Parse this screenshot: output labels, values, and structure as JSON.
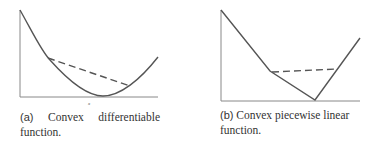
{
  "figures": [
    {
      "id": "a",
      "label": "(a)",
      "caption_line1_words": [
        "Convex",
        "differentiable"
      ],
      "caption_line2": "function.",
      "axis_label_x": "x",
      "curve_type": "smooth convex (parabola-like)",
      "chord": "dashed"
    },
    {
      "id": "b",
      "label": "(b)",
      "caption_line1": "Convex piecewise linear",
      "caption_line2": "function.",
      "curve_type": "piecewise linear convex",
      "chord": "dashed"
    }
  ],
  "colors": {
    "line": "#555555",
    "axis": "#777777",
    "text": "#333333"
  }
}
